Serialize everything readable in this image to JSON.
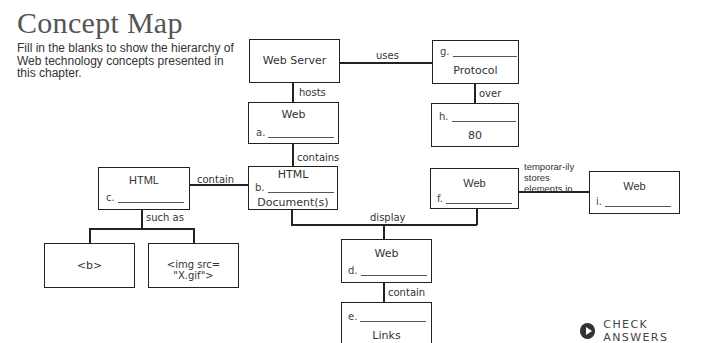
{
  "header": {
    "title": "Concept Map",
    "instructions": "Fill in the blanks to show the hierarchy of Web technology concepts presented in this chapter."
  },
  "nodes": {
    "web_server": {
      "text": "Web Server"
    },
    "protocol": {
      "blank_label": "g.",
      "text": "Protocol"
    },
    "web_a": {
      "text": "Web",
      "blank_label": "a."
    },
    "port": {
      "blank_label": "h.",
      "text": "80"
    },
    "html_c": {
      "text": "HTML",
      "blank_label": "c."
    },
    "html_doc": {
      "text_top": "HTML",
      "blank_label": "b.",
      "text_bottom": "Document(s)"
    },
    "web_f": {
      "text": "Web",
      "blank_label": "f."
    },
    "web_i": {
      "text": "Web",
      "blank_label": "i."
    },
    "tag_b": {
      "text": "<b>"
    },
    "tag_img": {
      "text": "<img src= \"X.gif\">"
    },
    "web_d": {
      "text": "Web",
      "blank_label": "d."
    },
    "links": {
      "blank_label": "e.",
      "text": "Links"
    }
  },
  "edges": {
    "uses": "uses",
    "hosts": "hosts",
    "over": "over",
    "contains": "contains",
    "contain_left": "contain",
    "such_as": "such as",
    "display": "display",
    "temporarily": "temporar-ily stores elements in",
    "contain_bottom": "contain"
  },
  "actions": {
    "check_answers": "CHECK ANSWERS"
  }
}
